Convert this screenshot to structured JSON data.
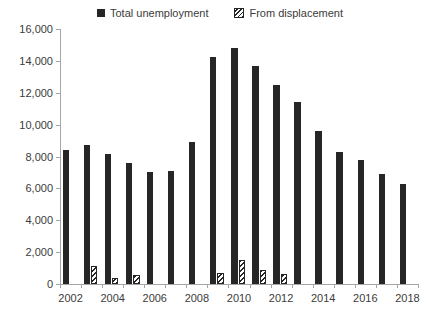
{
  "chart_data": {
    "type": "bar",
    "title": "",
    "subtitle": "",
    "xlabel": "",
    "ylabel": "",
    "grid": false,
    "legend_position": "top-center",
    "categories": [
      2002,
      2003,
      2004,
      2005,
      2006,
      2007,
      2008,
      2009,
      2010,
      2011,
      2012,
      2013,
      2014,
      2015,
      2016,
      2017,
      2018
    ],
    "xtick_labels": [
      "2002",
      "2004",
      "2006",
      "2008",
      "2010",
      "2012",
      "2014",
      "2016",
      "2018"
    ],
    "xtick_categories": [
      2002,
      2004,
      2006,
      2008,
      2010,
      2012,
      2014,
      2016,
      2018
    ],
    "ylim": [
      0,
      16000
    ],
    "ytick_values": [
      0,
      2000,
      4000,
      6000,
      8000,
      10000,
      12000,
      14000,
      16000
    ],
    "ytick_labels": [
      "0",
      "2,000",
      "4,000",
      "6,000",
      "8,000",
      "10,000",
      "12,000",
      "14,000",
      "16,000"
    ],
    "series": [
      {
        "name": "Total unemployment",
        "style": "solid",
        "color": "#262626",
        "values": [
          8400,
          8750,
          8150,
          7600,
          7000,
          7100,
          8900,
          14250,
          14800,
          13700,
          12500,
          11450,
          9600,
          8300,
          7750,
          6900,
          6250
        ]
      },
      {
        "name": "From displacement",
        "style": "diagonal-hatch",
        "color": "#262626",
        "values": [
          null,
          1100,
          350,
          550,
          null,
          null,
          null,
          700,
          1500,
          850,
          650,
          null,
          null,
          null,
          null,
          null,
          null
        ]
      }
    ]
  },
  "legend": {
    "items": [
      {
        "label": "Total unemployment",
        "swatch": "solid-square-icon"
      },
      {
        "label": "From displacement",
        "swatch": "hatched-square-icon"
      }
    ]
  }
}
